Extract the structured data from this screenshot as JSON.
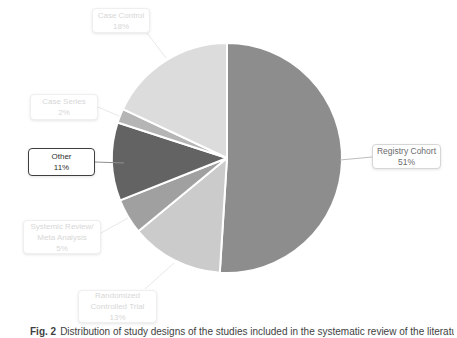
{
  "caption": {
    "prefix": "Fig. 2",
    "text": "Distribution of study designs of the studies included in the systematic review of the literature"
  },
  "chart_data": {
    "type": "pie",
    "title": "",
    "start_angle_deg": 0,
    "direction": "clockwise",
    "legend_position": "callout-labels",
    "gap_stroke_color": "#ffffff",
    "slices": [
      {
        "name": "Registry Cohort",
        "value": 51,
        "pct_label": "51%",
        "color": "#8d8d8d",
        "label_style": "medium",
        "label_lines": [
          "Registry Cohort",
          "51%"
        ]
      },
      {
        "name": "Randomized Controlled Trial",
        "value": 13,
        "pct_label": "13%",
        "color": "#cbcbcb",
        "label_style": "faint",
        "label_lines": [
          "Randomized",
          "Controlled Trial",
          "13%"
        ]
      },
      {
        "name": "Systemic Review/Meta Analysis",
        "value": 5,
        "pct_label": "5%",
        "color": "#a0a0a0",
        "label_style": "faint",
        "label_lines": [
          "Systemic Review/",
          "Meta Analysis",
          "5%"
        ]
      },
      {
        "name": "Other",
        "value": 11,
        "pct_label": "11%",
        "color": "#636363",
        "label_style": "dark",
        "label_lines": [
          "Other",
          "11%"
        ]
      },
      {
        "name": "Case Series",
        "value": 2,
        "pct_label": "2%",
        "color": "#b5b5b5",
        "label_style": "faint",
        "label_lines": [
          "Case Series",
          "2%"
        ]
      },
      {
        "name": "Case Control",
        "value": 18,
        "pct_label": "18%",
        "color": "#dcdcdc",
        "label_style": "faint",
        "label_lines": [
          "Case Control",
          "18%"
        ]
      }
    ]
  }
}
